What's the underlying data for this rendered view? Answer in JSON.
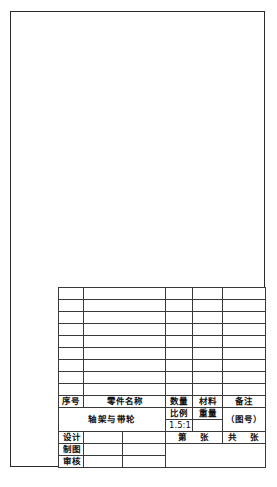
{
  "sheet": {
    "name": "engineering-drawing-sheet",
    "frame_color": "#2b2b2b",
    "background": "#ffffff"
  },
  "title_block": {
    "bom": {
      "empty_row_count": 9,
      "columns": [
        "序号",
        "零件名称",
        "数量",
        "材料",
        "备注"
      ]
    },
    "header": {
      "seq_no": "序号",
      "part_name": "零件名称",
      "quantity": "数量",
      "material": "材料",
      "remarks": "备注"
    },
    "part": {
      "name": "轴架与带轮",
      "scale_label": "比例",
      "scale_value": "1.5:1",
      "weight_label": "重量",
      "weight_value": "",
      "drawing_no": "（图号）"
    },
    "signoff": {
      "design_label": "设计",
      "design_name": "",
      "design_date": "",
      "draft_label": "制图",
      "draft_name": "",
      "draft_date": "",
      "review_label": "审核",
      "review_name": "",
      "review_date": "",
      "sheet_current": "第　张",
      "sheet_total": "共　张"
    }
  }
}
